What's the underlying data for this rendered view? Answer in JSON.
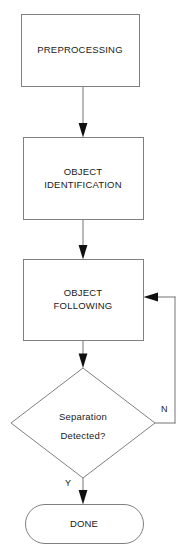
{
  "diagram": {
    "type": "flowchart",
    "background_color": "#ffffff",
    "shape_stroke_color": "#808080",
    "connector_color": "#808080",
    "arrowhead_color": "#101010",
    "text_color": "#1a1a1a"
  },
  "nodes": [
    {
      "id": "preprocessing",
      "shape": "rectangle",
      "label": "PREPROCESSING",
      "lines": [
        "PREPROCESSING"
      ]
    },
    {
      "id": "object_identification",
      "shape": "rectangle",
      "label": "OBJECT IDENTIFICATION",
      "lines": [
        "OBJECT",
        "IDENTIFICATION"
      ]
    },
    {
      "id": "object_following",
      "shape": "rectangle",
      "label": "OBJECT FOLLOWING",
      "lines": [
        "OBJECT",
        "FOLLOWING"
      ]
    },
    {
      "id": "separation_detected",
      "shape": "diamond",
      "label": "Separation Detected?",
      "lines": [
        "Separation",
        "Detected?"
      ]
    },
    {
      "id": "done",
      "shape": "terminator",
      "label": "DONE",
      "lines": [
        "DONE"
      ]
    }
  ],
  "node_text": {
    "preprocessing_line1": "PREPROCESSING",
    "identification_line1": "OBJECT",
    "identification_line2": "IDENTIFICATION",
    "following_line1": "OBJECT",
    "following_line2": "FOLLOWING",
    "decision_line1": "Separation",
    "decision_line2": "Detected?",
    "done_line1": "DONE"
  },
  "edges": [
    {
      "id": "edge-preprocessing-to-identification",
      "from": "preprocessing",
      "to": "object_identification",
      "label": ""
    },
    {
      "id": "edge-identification-to-following",
      "from": "object_identification",
      "to": "object_following",
      "label": ""
    },
    {
      "id": "edge-following-to-decision",
      "from": "object_following",
      "to": "separation_detected",
      "label": ""
    },
    {
      "id": "edge-decision-no-loop",
      "from": "separation_detected",
      "to": "object_following",
      "label": "N"
    },
    {
      "id": "edge-decision-yes-done",
      "from": "separation_detected",
      "to": "done",
      "label": "Y"
    }
  ],
  "edge_labels": {
    "no_branch": "N",
    "yes_branch": "Y"
  }
}
